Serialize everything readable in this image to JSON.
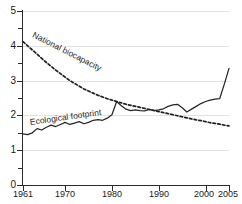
{
  "chart_data": {
    "type": "line",
    "title": "",
    "subtitle": "",
    "xlabel": "",
    "ylabel": "",
    "xlim": [
      1961,
      2005
    ],
    "ylim": [
      0,
      5
    ],
    "grid": "horizontal",
    "legend": "inline-annotations",
    "y_ticks": [
      "0",
      "1",
      "2",
      "3",
      "4",
      "5"
    ],
    "y_tick_values": [
      0,
      1,
      2,
      3,
      4,
      5
    ],
    "y_minor_tick_values": [
      0.5,
      1.5,
      2.5,
      3.5,
      4.5
    ],
    "x_ticks": [
      "1961",
      "1970",
      "1980",
      "1990",
      "2000",
      "2005"
    ],
    "x_tick_values": [
      1961,
      1970,
      1980,
      1990,
      2000,
      2005
    ],
    "x": [
      1961,
      1962,
      1963,
      1964,
      1965,
      1966,
      1967,
      1968,
      1969,
      1970,
      1971,
      1972,
      1973,
      1974,
      1975,
      1976,
      1977,
      1978,
      1979,
      1980,
      1981,
      1982,
      1983,
      1984,
      1985,
      1986,
      1987,
      1988,
      1989,
      1990,
      1991,
      1992,
      1993,
      1994,
      1995,
      1996,
      1997,
      1998,
      1999,
      2000,
      2001,
      2002,
      2003,
      2004,
      2005
    ],
    "series": [
      {
        "name": "Ecological footprint",
        "style": "solid",
        "color": "#262626",
        "values": [
          1.47,
          1.45,
          1.5,
          1.62,
          1.58,
          1.66,
          1.72,
          1.68,
          1.74,
          1.8,
          1.74,
          1.78,
          1.82,
          1.76,
          1.8,
          1.86,
          1.88,
          1.86,
          1.92,
          2.02,
          2.4,
          2.28,
          2.18,
          2.14,
          2.16,
          2.14,
          2.13,
          2.17,
          2.14,
          2.16,
          2.19,
          2.26,
          2.3,
          2.32,
          2.22,
          2.1,
          2.18,
          2.26,
          2.34,
          2.4,
          2.44,
          2.47,
          2.48,
          2.9,
          3.35
        ]
      },
      {
        "name": "National biocapacity",
        "style": "dashed",
        "color": "#1f1f1f",
        "values": [
          4.12,
          4.0,
          3.88,
          3.76,
          3.64,
          3.52,
          3.41,
          3.3,
          3.2,
          3.1,
          3.0,
          2.92,
          2.84,
          2.76,
          2.7,
          2.64,
          2.58,
          2.53,
          2.48,
          2.44,
          2.4,
          2.36,
          2.32,
          2.29,
          2.26,
          2.23,
          2.2,
          2.17,
          2.14,
          2.11,
          2.08,
          2.05,
          2.02,
          1.99,
          1.96,
          1.93,
          1.9,
          1.87,
          1.85,
          1.82,
          1.79,
          1.77,
          1.75,
          1.72,
          1.7
        ]
      }
    ],
    "annotations": [
      {
        "id": "biocapacity",
        "text": "National biocapacity"
      },
      {
        "id": "footprint",
        "text": "Ecological footprint"
      }
    ]
  }
}
